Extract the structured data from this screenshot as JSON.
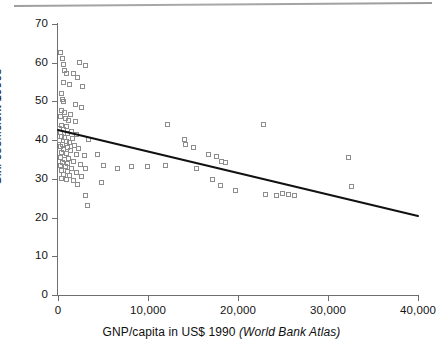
{
  "chart_data": {
    "type": "scatter",
    "title": "",
    "xlabel": "GNP/capita in US$ 1990 (World Bank Atlas)",
    "xlabel_plain": "GNP/capita in US$ 1990 ",
    "xlabel_italic": "(World Bank Atlas)",
    "ylabel": "Gini coefficient 1990s",
    "xlim": [
      0,
      40000
    ],
    "ylim": [
      0,
      70
    ],
    "xticks": [
      0,
      10000,
      20000,
      30000,
      40000
    ],
    "xtick_labels": [
      "0",
      "10,000",
      "20,000",
      "30,000",
      "40,000"
    ],
    "yticks": [
      0,
      10,
      20,
      30,
      40,
      50,
      60,
      70
    ],
    "ytick_labels": [
      "0",
      "10",
      "20",
      "30",
      "40",
      "50",
      "60",
      "70"
    ],
    "grid": false,
    "legend": null,
    "marker": "open-square",
    "marker_color": "#8d8d8d",
    "trendline": {
      "type": "linear-fit",
      "color": "#111111",
      "x_start": 0,
      "y_start": 42.6,
      "x_end": 40000,
      "y_end": 20.4
    },
    "points": [
      {
        "x": 300,
        "y": 62.6
      },
      {
        "x": 500,
        "y": 61.2
      },
      {
        "x": 600,
        "y": 59.6
      },
      {
        "x": 2400,
        "y": 60.0
      },
      {
        "x": 3100,
        "y": 59.3
      },
      {
        "x": 700,
        "y": 58.1
      },
      {
        "x": 900,
        "y": 57.3
      },
      {
        "x": 1700,
        "y": 57.3
      },
      {
        "x": 2200,
        "y": 56.2
      },
      {
        "x": 600,
        "y": 55.0
      },
      {
        "x": 1300,
        "y": 54.5
      },
      {
        "x": 2700,
        "y": 53.8
      },
      {
        "x": 400,
        "y": 52.1
      },
      {
        "x": 500,
        "y": 50.6
      },
      {
        "x": 600,
        "y": 50.0
      },
      {
        "x": 1900,
        "y": 49.3
      },
      {
        "x": 2600,
        "y": 48.5
      },
      {
        "x": 400,
        "y": 47.6
      },
      {
        "x": 700,
        "y": 47.2
      },
      {
        "x": 1400,
        "y": 46.6
      },
      {
        "x": 300,
        "y": 46.0
      },
      {
        "x": 800,
        "y": 45.5
      },
      {
        "x": 1200,
        "y": 45.1
      },
      {
        "x": 1900,
        "y": 44.7
      },
      {
        "x": 12200,
        "y": 44.0
      },
      {
        "x": 22800,
        "y": 44.1
      },
      {
        "x": 400,
        "y": 43.8
      },
      {
        "x": 900,
        "y": 43.4
      },
      {
        "x": 200,
        "y": 43.0
      },
      {
        "x": 600,
        "y": 42.7
      },
      {
        "x": 1500,
        "y": 42.3
      },
      {
        "x": 300,
        "y": 42.0
      },
      {
        "x": 1000,
        "y": 41.7
      },
      {
        "x": 2000,
        "y": 41.4
      },
      {
        "x": 400,
        "y": 41.0
      },
      {
        "x": 700,
        "y": 40.7
      },
      {
        "x": 1600,
        "y": 40.4
      },
      {
        "x": 3400,
        "y": 40.2
      },
      {
        "x": 200,
        "y": 40.0
      },
      {
        "x": 900,
        "y": 39.6
      },
      {
        "x": 1300,
        "y": 39.3
      },
      {
        "x": 500,
        "y": 39.0
      },
      {
        "x": 1800,
        "y": 38.7
      },
      {
        "x": 300,
        "y": 38.4
      },
      {
        "x": 1100,
        "y": 38.1
      },
      {
        "x": 2300,
        "y": 37.9
      },
      {
        "x": 600,
        "y": 37.5
      },
      {
        "x": 1400,
        "y": 37.2
      },
      {
        "x": 400,
        "y": 36.9
      },
      {
        "x": 900,
        "y": 36.5
      },
      {
        "x": 2000,
        "y": 36.2
      },
      {
        "x": 2900,
        "y": 36.0
      },
      {
        "x": 300,
        "y": 35.6
      },
      {
        "x": 1200,
        "y": 35.2
      },
      {
        "x": 700,
        "y": 34.9
      },
      {
        "x": 1700,
        "y": 34.6
      },
      {
        "x": 500,
        "y": 34.3
      },
      {
        "x": 1000,
        "y": 34.0
      },
      {
        "x": 2500,
        "y": 33.8
      },
      {
        "x": 300,
        "y": 33.4
      },
      {
        "x": 800,
        "y": 33.1
      },
      {
        "x": 1500,
        "y": 32.8
      },
      {
        "x": 3000,
        "y": 32.6
      },
      {
        "x": 400,
        "y": 32.2
      },
      {
        "x": 1100,
        "y": 31.9
      },
      {
        "x": 2100,
        "y": 31.6
      },
      {
        "x": 600,
        "y": 31.2
      },
      {
        "x": 1300,
        "y": 30.9
      },
      {
        "x": 2600,
        "y": 30.5
      },
      {
        "x": 400,
        "y": 30.2
      },
      {
        "x": 900,
        "y": 29.8
      },
      {
        "x": 1700,
        "y": 29.5
      },
      {
        "x": 2200,
        "y": 28.6
      },
      {
        "x": 3100,
        "y": 25.8
      },
      {
        "x": 3300,
        "y": 23.2
      },
      {
        "x": 5000,
        "y": 33.5
      },
      {
        "x": 6600,
        "y": 32.8
      },
      {
        "x": 4400,
        "y": 36.4
      },
      {
        "x": 4800,
        "y": 29.1
      },
      {
        "x": 8200,
        "y": 33.3
      },
      {
        "x": 9900,
        "y": 33.2
      },
      {
        "x": 11900,
        "y": 33.4
      },
      {
        "x": 14200,
        "y": 38.8
      },
      {
        "x": 14000,
        "y": 40.2
      },
      {
        "x": 15100,
        "y": 38.0
      },
      {
        "x": 15400,
        "y": 32.6
      },
      {
        "x": 16700,
        "y": 36.2
      },
      {
        "x": 17600,
        "y": 35.7
      },
      {
        "x": 18200,
        "y": 34.6
      },
      {
        "x": 18600,
        "y": 34.3
      },
      {
        "x": 17200,
        "y": 29.8
      },
      {
        "x": 18100,
        "y": 28.3
      },
      {
        "x": 19700,
        "y": 27.0
      },
      {
        "x": 23000,
        "y": 25.9
      },
      {
        "x": 24300,
        "y": 25.7
      },
      {
        "x": 24900,
        "y": 26.2
      },
      {
        "x": 25600,
        "y": 26.0
      },
      {
        "x": 26300,
        "y": 25.6
      },
      {
        "x": 32300,
        "y": 35.6
      },
      {
        "x": 32600,
        "y": 28.0
      }
    ]
  }
}
